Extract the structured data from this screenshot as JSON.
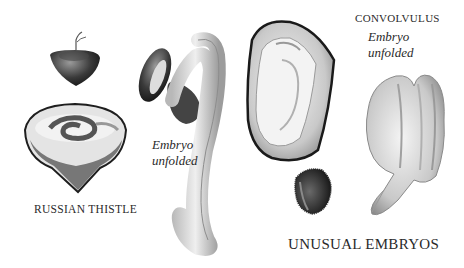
{
  "title": "UNUSUAL EMBRYOS",
  "specimens": [
    {
      "name": "RUSSIAN THISTLE",
      "note": "Embryo unfolded"
    },
    {
      "name": "CONVOLVULUS",
      "note": "Embryo unfolded"
    }
  ],
  "labels": {
    "russian_thistle": "RUSSIAN THISTLE",
    "convolvulus": "CONVOLVULUS",
    "thistle_note_line1": "Embryo",
    "thistle_note_line2": "unfolded",
    "convolvulus_note_line1": "Embryo",
    "convolvulus_note_line2": "unfolded",
    "caption": "UNUSUAL EMBRYOS"
  }
}
